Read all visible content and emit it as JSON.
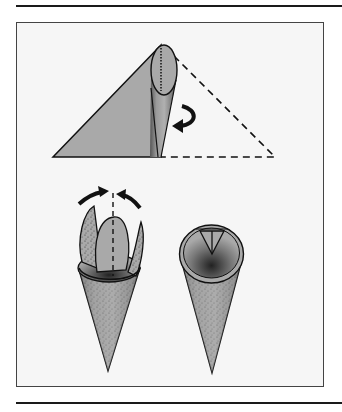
{
  "figure": {
    "type": "instructional-illustration",
    "steps": [
      {
        "id": "step-roll-triangle",
        "description": "Triangle with left half shaded, rolled from apex, curved arrow indicating roll direction, dashed outline of unrolled right half"
      },
      {
        "id": "step-fold-points",
        "description": "Cone with protruding points and two curved arrows folding them inward along a dashed centre line"
      },
      {
        "id": "step-finished-cone",
        "description": "Finished cone with points folded inside"
      }
    ]
  },
  "colors": {
    "fill": "#a9a9a9",
    "stroke": "#111111",
    "frame_bg": "#f6f6f6",
    "frame_border": "#444444"
  }
}
